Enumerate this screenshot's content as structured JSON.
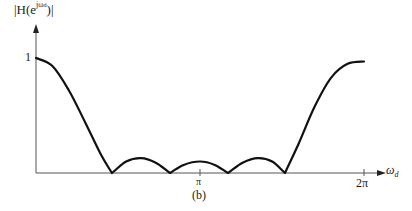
{
  "chart_data": {
    "type": "line",
    "title": "",
    "subtitle": "(b)",
    "xlabel": "ω_d",
    "ylabel": "|H(e^{jω_d})|",
    "x_ticks": [
      {
        "label": "π",
        "value_over_pi": 1.0
      },
      {
        "label": "2π",
        "value_over_pi": 2.0
      }
    ],
    "y_ticks": [
      {
        "label": "1",
        "value": 1.0
      }
    ],
    "xlim_over_pi": [
      0,
      2.12
    ],
    "ylim": [
      0,
      1.35
    ],
    "grid": false,
    "legend": null,
    "series": [
      {
        "name": "|H(e^{jω_d})|",
        "x_over_pi": [
          0.0,
          0.1,
          0.2,
          0.3,
          0.4,
          0.463,
          0.55,
          0.64,
          0.73,
          0.817,
          0.9,
          1.0,
          1.09,
          1.171,
          1.26,
          1.353,
          1.44,
          1.518,
          1.6,
          1.7,
          1.8,
          1.9,
          2.0
        ],
        "values": [
          1.0,
          0.93,
          0.72,
          0.44,
          0.15,
          0.0,
          0.1,
          0.13,
          0.09,
          0.0,
          0.07,
          0.1,
          0.07,
          0.0,
          0.09,
          0.13,
          0.1,
          0.0,
          0.25,
          0.58,
          0.83,
          0.95,
          0.97
        ]
      }
    ],
    "annotations": {
      "zeros_over_pi": [
        0.463,
        0.817,
        1.171,
        1.518
      ],
      "sidelobe_peaks": [
        {
          "x_over_pi": 0.64,
          "value": 0.13
        },
        {
          "x_over_pi": 1.0,
          "value": 0.1
        },
        {
          "x_over_pi": 1.353,
          "value": 0.13
        }
      ]
    }
  },
  "labels": {
    "y_axis_prefix": "|H(e",
    "y_axis_sup": "jω",
    "y_axis_sup_sub": "d",
    "y_axis_suffix": ")|",
    "y_tick_1": "1",
    "x_tick_pi": "π",
    "x_tick_2pi": "2π",
    "x_axis_main": "ω",
    "x_axis_sub": "d",
    "caption": "(b)"
  }
}
